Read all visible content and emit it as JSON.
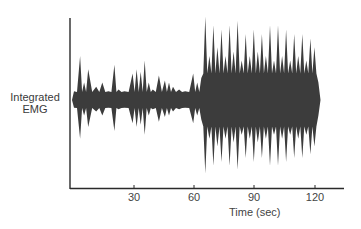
{
  "chart_data": {
    "type": "area",
    "title": "",
    "xlabel": "Time (sec)",
    "ylabel": "Integrated EMG",
    "x_ticks": [
      "30",
      "60",
      "90",
      "120"
    ],
    "xlim": [
      0,
      130
    ],
    "grid": false,
    "legend": null,
    "series": [
      {
        "name": "Integrated EMG amplitude (relative, 0-1)",
        "x": [
          1,
          4,
          6,
          8,
          12,
          15,
          18,
          21,
          23,
          26,
          30,
          32,
          34,
          36,
          38,
          40,
          43,
          46,
          48,
          50,
          53,
          56,
          60,
          62,
          64,
          66,
          68,
          70,
          72,
          74,
          76,
          78,
          80,
          82,
          84,
          86,
          88,
          90,
          92,
          94,
          96,
          98,
          100,
          102,
          104,
          106,
          108,
          110,
          112,
          114,
          116,
          118,
          120,
          122
        ],
        "values": [
          0.1,
          0.5,
          0.2,
          0.35,
          0.15,
          0.2,
          0.1,
          0.4,
          0.12,
          0.1,
          0.3,
          0.35,
          0.32,
          0.45,
          0.2,
          0.12,
          0.28,
          0.22,
          0.2,
          0.15,
          0.12,
          0.1,
          0.3,
          0.2,
          0.25,
          0.95,
          0.5,
          0.85,
          0.6,
          0.8,
          0.5,
          0.85,
          0.55,
          0.9,
          0.45,
          0.75,
          0.5,
          0.8,
          0.55,
          0.75,
          0.5,
          0.85,
          0.45,
          0.85,
          0.5,
          0.8,
          0.45,
          0.75,
          0.5,
          0.75,
          0.45,
          0.7,
          0.6,
          0.2
        ]
      }
    ]
  },
  "axis": {
    "ylabel_line1": "Integrated",
    "ylabel_line2": "EMG",
    "xlabel": "Time (sec)",
    "ticks": [
      {
        "label": "30",
        "x": 30
      },
      {
        "label": "60",
        "x": 60
      },
      {
        "label": "90",
        "x": 90
      },
      {
        "label": "120",
        "x": 120
      }
    ]
  },
  "colors": {
    "signal": "#3c3c3c",
    "axis": "#2a2a2a"
  }
}
